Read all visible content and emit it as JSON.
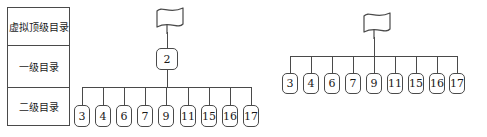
{
  "colors": {
    "background": "#ffffff",
    "line": "#4a4a4a",
    "text": "#1a1a1a"
  },
  "legend": {
    "rows": [
      "虚拟顶级目录",
      "一级目录",
      "二级目录"
    ]
  },
  "left_tree": {
    "flag": "flag-icon",
    "root": "2",
    "children": [
      "3",
      "4",
      "6",
      "7",
      "9",
      "11",
      "15",
      "16",
      "17"
    ]
  },
  "right_tree": {
    "flag": "flag-icon",
    "children": [
      "3",
      "4",
      "6",
      "7",
      "9",
      "11",
      "15",
      "16",
      "17"
    ]
  }
}
